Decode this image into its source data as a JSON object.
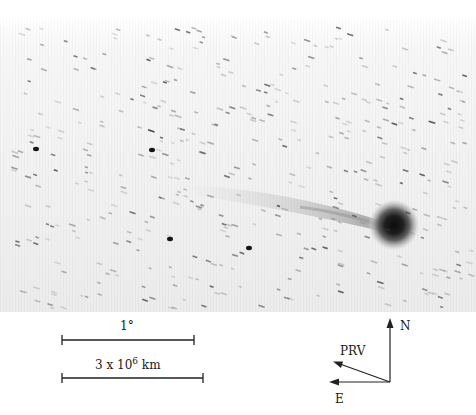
{
  "figure": {
    "scale_bars": [
      {
        "label": "1°",
        "length_px": 132
      },
      {
        "label_prefix": "3 x 10",
        "label_exp": "6",
        "label_unit": " km",
        "length_px": 141
      }
    ],
    "orientation": {
      "north_label": "N",
      "east_label": "E",
      "prv_label": "PRV"
    }
  }
}
